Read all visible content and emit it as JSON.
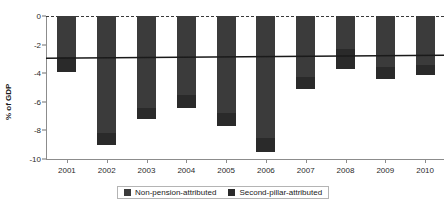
{
  "chart_data": {
    "type": "bar",
    "stacked": true,
    "title": "",
    "subtitle": "",
    "xlabel": "",
    "ylabel": "% of GDP",
    "categories": [
      "2001",
      "2002",
      "2003",
      "2004",
      "2005",
      "2006",
      "2007",
      "2008",
      "2009",
      "2010"
    ],
    "ylim": [
      -10,
      0
    ],
    "ytick_labels": [
      "0",
      "-2",
      "-4",
      "-6",
      "-8",
      "-10"
    ],
    "ytick_values": [
      0,
      -2,
      -4,
      -6,
      -8,
      -10
    ],
    "grid": false,
    "legend_position": "bottom",
    "series": [
      {
        "name": "Non-pension-attributed",
        "color": "#3b3b3b",
        "values": [
          -2.9,
          -8.2,
          -6.4,
          -5.5,
          -6.8,
          -8.5,
          -4.3,
          -2.3,
          -3.6,
          -3.4
        ]
      },
      {
        "name": "Second-pillar-attributed",
        "color": "#2a2a2a",
        "values": [
          -1.0,
          -0.8,
          -0.8,
          -0.9,
          -0.9,
          -1.0,
          -0.8,
          -1.4,
          -0.8,
          -0.7
        ]
      }
    ],
    "totals": [
      -3.9,
      -9.0,
      -7.2,
      -6.4,
      -7.7,
      -9.5,
      -5.1,
      -3.7,
      -4.4,
      -4.1
    ],
    "annotations": [
      {
        "type": "reference-line",
        "name": "average-line",
        "orientation": "horizontal-trend",
        "start_value": -2.95,
        "end_value": -2.75,
        "color": "#1a1a1a"
      },
      {
        "type": "reference-line",
        "name": "zero-line",
        "orientation": "horizontal",
        "value": 0,
        "style": "dashed",
        "color": "#3a3a3a"
      }
    ]
  },
  "legend": {
    "entries": [
      {
        "label": "Non-pension-attributed",
        "color": "#3b3b3b"
      },
      {
        "label": "Second-pillar-attributed",
        "color": "#2a2a2a"
      }
    ]
  }
}
